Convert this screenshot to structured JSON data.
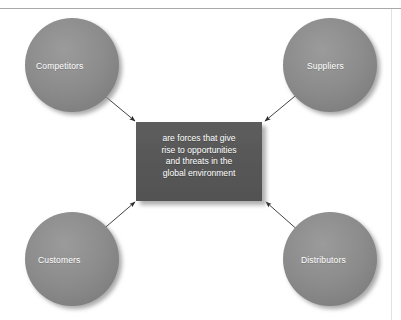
{
  "figure": {
    "type": "hub-and-spoke-diagram",
    "background_color": "#ffffff",
    "rule_color": "#a9a9a9",
    "node_fill": "#8a8a8a",
    "center_fill": "#585858",
    "arrow_color": "#2b2b2b",
    "label_color": "#ffffff"
  },
  "center": {
    "name": "central-statement-box",
    "lines": [
      "are forces that give",
      "rise to opportunities",
      "and threats in the",
      "global environment"
    ],
    "full_text": "are forces that give rise to opportunities and threats in the global environment"
  },
  "nodes": [
    {
      "id": "competitors",
      "label": "Competitors",
      "position": "top-left"
    },
    {
      "id": "suppliers",
      "label": "Suppliers",
      "position": "top-right"
    },
    {
      "id": "customers",
      "label": "Customers",
      "position": "bottom-left"
    },
    {
      "id": "distributors",
      "label": "Distributors",
      "position": "bottom-right"
    }
  ],
  "connectors": [
    {
      "from": "competitors",
      "to": "center",
      "direction": "to-center",
      "arrowhead": "filled"
    },
    {
      "from": "suppliers",
      "to": "center",
      "direction": "to-center",
      "arrowhead": "filled"
    },
    {
      "from": "customers",
      "to": "center",
      "direction": "to-center",
      "arrowhead": "filled"
    },
    {
      "from": "distributors",
      "to": "center",
      "direction": "to-center",
      "arrowhead": "filled"
    }
  ]
}
